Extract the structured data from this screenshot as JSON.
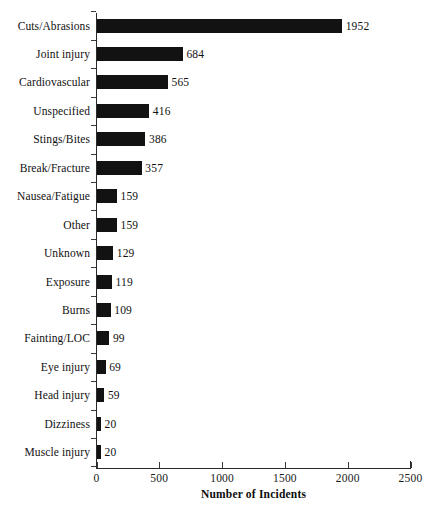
{
  "chart_data": {
    "type": "bar",
    "orientation": "horizontal",
    "title": "",
    "xlabel": "Number of Incidents",
    "ylabel": "",
    "xlim": [
      0,
      2500
    ],
    "xticks": [
      0,
      500,
      1000,
      1500,
      2000,
      2500
    ],
    "xtick_labels": [
      "0",
      "500",
      "1000",
      "1500",
      "2000",
      "2500"
    ],
    "grid": false,
    "legend": false,
    "bar_color": "#121212",
    "categories": [
      "Cuts/Abrasions",
      "Joint injury",
      "Cardiovascular",
      "Unspecified",
      "Stings/Bites",
      "Break/Fracture",
      "Nausea/Fatigue",
      "Other",
      "Unknown",
      "Exposure",
      "Burns",
      "Fainting/LOC",
      "Eye injury",
      "Head injury",
      "Dizziness",
      "Muscle injury"
    ],
    "values": [
      1952,
      684,
      565,
      416,
      386,
      357,
      159,
      159,
      129,
      119,
      109,
      99,
      69,
      59,
      20,
      20
    ],
    "value_labels": [
      "1952",
      "684",
      "565",
      "416",
      "386",
      "357",
      "159",
      "159",
      "129",
      "119",
      "109",
      "99",
      "69",
      "59",
      "20",
      "20"
    ]
  }
}
